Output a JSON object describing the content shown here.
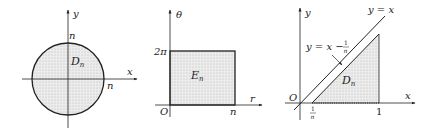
{
  "colors": {
    "stroke": "#222222",
    "shade": "#dcdcdc",
    "dot": "#b8b8b8",
    "background": "#ffffff"
  },
  "panels": [
    {
      "id": "disk",
      "region_label": "D",
      "region_sub": "n",
      "axis_x_label": "x",
      "axis_y_label": "y",
      "top_label": "n",
      "right_label": "n"
    },
    {
      "id": "rectangle",
      "region_label": "E",
      "region_sub": "n",
      "axis_x_label": "r",
      "axis_y_label": "θ",
      "origin_label": "O",
      "y_tick_label": "2π",
      "x_tick_label": "n"
    },
    {
      "id": "triangle",
      "region_label": "D",
      "region_sub": "n",
      "axis_x_label": "x",
      "axis_y_label": "y",
      "origin_label": "O",
      "line1_label": "y = x",
      "line2_label_prefix": "y = x −",
      "line2_frac_num": "1",
      "line2_frac_den": "n",
      "x_tick1_num": "1",
      "x_tick1_den": "n",
      "x_tick2_label": "1"
    }
  ]
}
